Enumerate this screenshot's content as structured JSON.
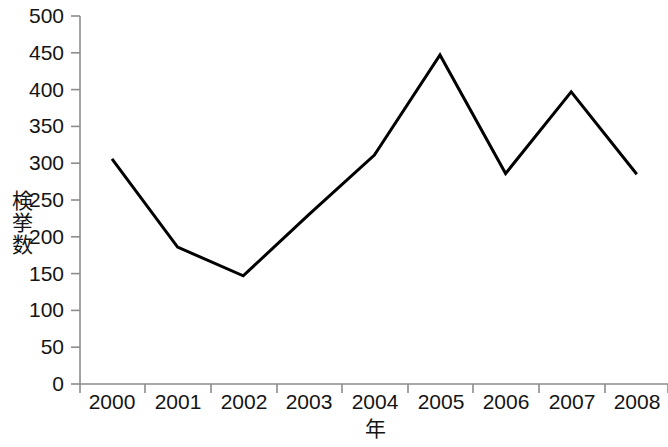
{
  "chart_data": {
    "type": "line",
    "title": "",
    "xlabel": "年",
    "ylabel": "検挙数",
    "categories": [
      "2000",
      "2001",
      "2002",
      "2003",
      "2004",
      "2005",
      "2006",
      "2007",
      "2008"
    ],
    "x": [
      2000,
      2001,
      2002,
      2003,
      2004,
      2005,
      2006,
      2007,
      2008
    ],
    "values": [
      306,
      186,
      147,
      230,
      311,
      447,
      286,
      397,
      285
    ],
    "series": [
      {
        "name": "検挙数",
        "values": [
          306,
          186,
          147,
          230,
          311,
          447,
          286,
          397,
          285
        ]
      }
    ],
    "ylim": [
      0,
      500
    ],
    "yticks": [
      0,
      50,
      100,
      150,
      200,
      250,
      300,
      350,
      400,
      450,
      500
    ],
    "ytick_labels": [
      "0",
      "50",
      "100",
      "150",
      "200",
      "250",
      "300",
      "350",
      "400",
      "450",
      "500"
    ],
    "xtick_labels": [
      "2000",
      "2001",
      "2002",
      "2003",
      "2004",
      "2005",
      "2006",
      "2007",
      "2008"
    ],
    "grid": false,
    "legend": false,
    "legend_position": "none",
    "line_color": "#000000",
    "axis_color": "#808080",
    "background_color": "#ffffff",
    "line_width": 3,
    "markers": false
  },
  "axes": {
    "y_title": "検挙数",
    "x_title": "年"
  }
}
